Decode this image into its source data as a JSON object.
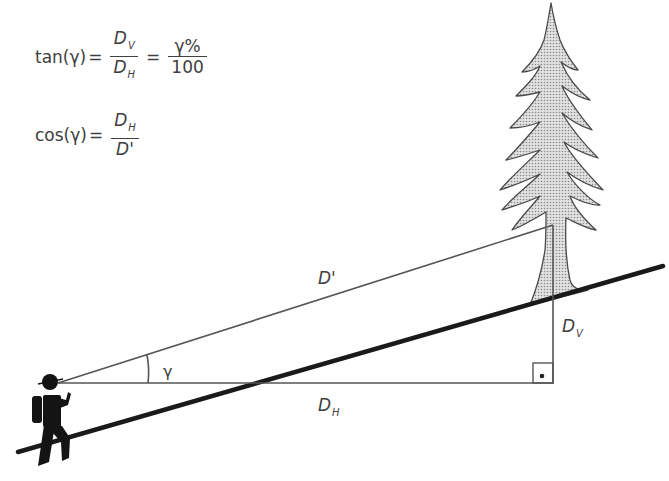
{
  "formulas": {
    "tan": {
      "lhs": "tan(γ)",
      "eq1": "=",
      "frac1_num_base": "D",
      "frac1_num_sub": "V",
      "frac1_den_base": "D",
      "frac1_den_sub": "H",
      "eq2": "=",
      "frac2_num": "γ%",
      "frac2_den": "100"
    },
    "cos": {
      "lhs": "cos(γ)",
      "eq1": "=",
      "frac_num_base": "D",
      "frac_num_sub": "H",
      "frac_den": "D'"
    }
  },
  "labels": {
    "slope_distance": "D'",
    "vertical_base": "D",
    "vertical_sub": "V",
    "horizontal_base": "D",
    "horizontal_sub": "H",
    "angle": "γ"
  },
  "colors": {
    "line": "#555555",
    "ground": "#1a1a1a",
    "tree_fill": "#c8c8c8",
    "tree_stroke": "#4a4a4a",
    "hiker": "#141414"
  }
}
